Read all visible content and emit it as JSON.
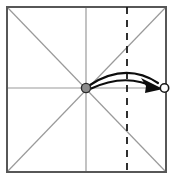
{
  "canvas": {
    "width": 173,
    "height": 180,
    "background": "#ffffff",
    "title": "Origami fold step diagram"
  },
  "colors": {
    "paper_edge": "#575757",
    "crease_line": "#9a9a9a",
    "fold_line": "#1a1a1a",
    "arrow": "#0d0d0d",
    "pivot_fill": "#8c8c8c",
    "pivot_stroke": "#2b2b2b",
    "target_fill": "#ffffff",
    "target_stroke": "#1a1a1a",
    "background": "#ffffff"
  },
  "figure": {
    "type": "origami-crease-pattern",
    "paper": {
      "label": "square-sheet",
      "x": 7,
      "y": 7,
      "width": 159,
      "height": 165,
      "stroke_width": 2.0
    },
    "creases": [
      {
        "name": "horizontal-midline-crease",
        "x1": 7,
        "y1": 88,
        "x2": 166,
        "y2": 88,
        "style": "solid",
        "width": 1.2
      },
      {
        "name": "vertical-midline-crease",
        "x1": 86,
        "y1": 7,
        "x2": 86,
        "y2": 172,
        "style": "solid",
        "width": 1.2
      },
      {
        "name": "diagonal-crease-tl-br",
        "x1": 7,
        "y1": 7,
        "x2": 166,
        "y2": 172,
        "style": "solid",
        "width": 1.2
      },
      {
        "name": "diagonal-crease-bl-tr",
        "x1": 7,
        "y1": 172,
        "x2": 166,
        "y2": 7,
        "style": "solid",
        "width": 1.2
      }
    ],
    "fold_line": {
      "name": "vertical-fold-line",
      "x1": 127,
      "y1": 7,
      "x2": 127,
      "y2": 172,
      "style": "dashed",
      "dash_pattern": "7 6",
      "width": 1.8
    },
    "pivot_point": {
      "name": "center-pivot-point",
      "cx": 86,
      "cy": 88,
      "r": 4.6,
      "stroke_width": 1.4
    },
    "target_point": {
      "name": "right-edge-target-point",
      "cx": 164.5,
      "cy": 88,
      "r": 4.2,
      "stroke_width": 1.6
    },
    "motion_arrows": [
      {
        "name": "fold-arc-outer",
        "path": "M 90 85 Q 126 62 158 83",
        "width": 2.2
      },
      {
        "name": "fold-arc-inner",
        "path": "M 90 89 Q 126 72 156 88",
        "width": 2.2
      }
    ],
    "arrowhead": {
      "name": "fold-arrowhead",
      "points": "141,78 163,89 145,93 146,86"
    }
  }
}
